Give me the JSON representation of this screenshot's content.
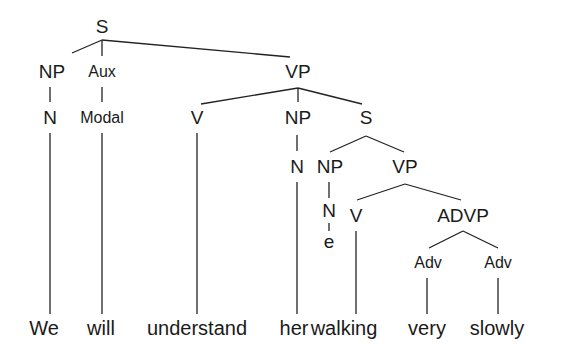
{
  "diagram": {
    "type": "syntax-tree",
    "sentence": "We will understand her walking very slowly",
    "nodes": {
      "s_root": "S",
      "np_subject": "NP",
      "aux": "Aux",
      "vp_main": "VP",
      "n_subject": "N",
      "modal": "Modal",
      "v_main": "V",
      "np_object": "NP",
      "s_embedded": "S",
      "n_object": "N",
      "np_embedded": "NP",
      "vp_embedded": "VP",
      "n_embedded": "N",
      "empty": "e",
      "v_embedded": "V",
      "advp": "ADVP",
      "adv_1": "Adv",
      "adv_2": "Adv"
    },
    "words": [
      "We",
      "will",
      "understand",
      "her",
      "walking",
      "very",
      "slowly"
    ],
    "line_color": "#222222",
    "text_color": "#1a1a1a"
  }
}
